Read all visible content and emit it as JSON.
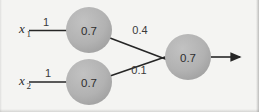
{
  "diagram": {
    "type": "neural-network",
    "title": "",
    "background_color": "#f4f4f2",
    "node_fill_color": "#b0b0b0",
    "line_color": "#262626",
    "text_color": "#2e2e2e",
    "inputs": [
      {
        "label": "x",
        "subscript": "1",
        "weight": "1"
      },
      {
        "label": "x",
        "subscript": "2",
        "weight": "1"
      }
    ],
    "hidden_nodes": [
      {
        "value": "0.7",
        "out_weight": "0.4"
      },
      {
        "value": "0.7",
        "out_weight": "0.1"
      }
    ],
    "output_node": {
      "value": "0.7"
    },
    "output_arrow": {
      "icon": "arrow-right-icon"
    }
  }
}
